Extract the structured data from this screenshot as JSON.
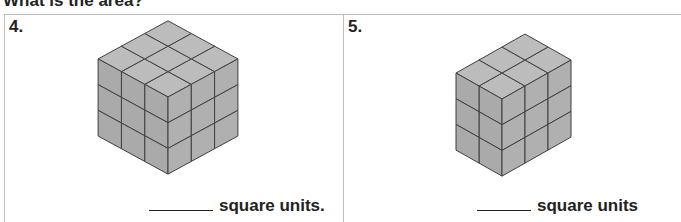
{
  "header": {
    "title": "What is the area?"
  },
  "problems": [
    {
      "number": "4.",
      "answer_suffix": "square units.",
      "figure": {
        "left_cols": 3,
        "right_cols": 3,
        "rows": 3
      }
    },
    {
      "number": "5.",
      "answer_suffix": "square units",
      "figure": {
        "left_cols": 2,
        "right_cols": 3,
        "rows": 3
      }
    }
  ],
  "colors": {
    "top": "#bcbcbc",
    "left": "#aaaaaa",
    "right": "#b0b0b0",
    "line": "#3f3f3f",
    "border": "#bdbdbd"
  }
}
